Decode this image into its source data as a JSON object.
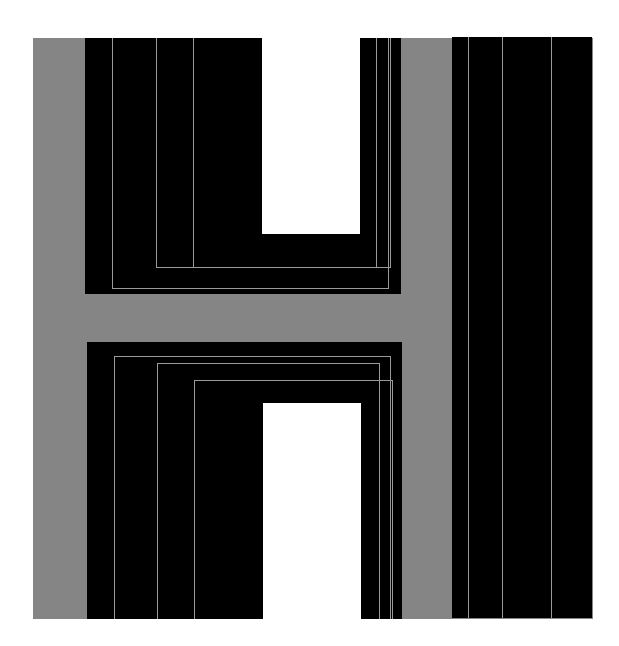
{
  "artwork": {
    "description": "Abstract geometric composition: letter H in black on grey with thin grey inset lines, plus a vertical black bar",
    "colors": {
      "background": "#ffffff",
      "grey": "#858585",
      "black": "#000000",
      "line": "#9a9a9a",
      "hole": "#ffffff"
    },
    "grey_field": {
      "x": 33,
      "y": 38,
      "w": 560,
      "h": 581
    },
    "blocks": [
      {
        "name": "upper-left-black-block",
        "x": 85,
        "y": 38,
        "w": 316,
        "h": 256
      },
      {
        "name": "lower-left-black-block",
        "x": 87,
        "y": 342,
        "w": 315,
        "h": 277
      },
      {
        "name": "right-black-bar",
        "x": 452,
        "y": 37,
        "w": 140,
        "h": 581
      }
    ],
    "holes": [
      {
        "name": "upper-white-notch",
        "x": 262,
        "y": 38,
        "w": 98,
        "h": 196
      },
      {
        "name": "lower-white-notch",
        "x": 263,
        "y": 403,
        "w": 98,
        "h": 216
      }
    ],
    "lines": [
      {
        "name": "upper-line-v1",
        "x": 112,
        "y": 38,
        "w": 1,
        "h": 251
      },
      {
        "name": "upper-line-h1",
        "x": 112,
        "y": 288,
        "w": 277,
        "h": 1
      },
      {
        "name": "upper-line-v1r",
        "x": 388,
        "y": 38,
        "w": 1,
        "h": 251
      },
      {
        "name": "upper-line-v2",
        "x": 156,
        "y": 38,
        "w": 1,
        "h": 230
      },
      {
        "name": "upper-line-h2",
        "x": 156,
        "y": 267,
        "w": 235,
        "h": 1
      },
      {
        "name": "upper-line-v2r",
        "x": 390,
        "y": 38,
        "w": 1,
        "h": 230
      },
      {
        "name": "upper-line-v3",
        "x": 193,
        "y": 38,
        "w": 1,
        "h": 230
      },
      {
        "name": "upper-line-v3r",
        "x": 376,
        "y": 38,
        "w": 1,
        "h": 230
      },
      {
        "name": "lower-line-h1",
        "x": 114,
        "y": 356,
        "w": 277,
        "h": 1
      },
      {
        "name": "lower-line-v1",
        "x": 114,
        "y": 356,
        "w": 1,
        "h": 263
      },
      {
        "name": "lower-line-v1r",
        "x": 390,
        "y": 356,
        "w": 1,
        "h": 263
      },
      {
        "name": "lower-line-h2",
        "x": 157,
        "y": 363,
        "w": 222,
        "h": 1
      },
      {
        "name": "lower-line-v2",
        "x": 157,
        "y": 363,
        "w": 1,
        "h": 256
      },
      {
        "name": "lower-line-v2r",
        "x": 379,
        "y": 363,
        "w": 1,
        "h": 256
      },
      {
        "name": "lower-line-h3",
        "x": 194,
        "y": 380,
        "w": 198,
        "h": 1
      },
      {
        "name": "lower-line-v3",
        "x": 194,
        "y": 380,
        "w": 1,
        "h": 239
      },
      {
        "name": "lower-line-v3r",
        "x": 392,
        "y": 380,
        "w": 1,
        "h": 239
      },
      {
        "name": "bar-line-1",
        "x": 468,
        "y": 37,
        "w": 1,
        "h": 581
      },
      {
        "name": "bar-line-2",
        "x": 502,
        "y": 37,
        "w": 1,
        "h": 581
      },
      {
        "name": "bar-line-3",
        "x": 551,
        "y": 37,
        "w": 1,
        "h": 581
      }
    ]
  }
}
